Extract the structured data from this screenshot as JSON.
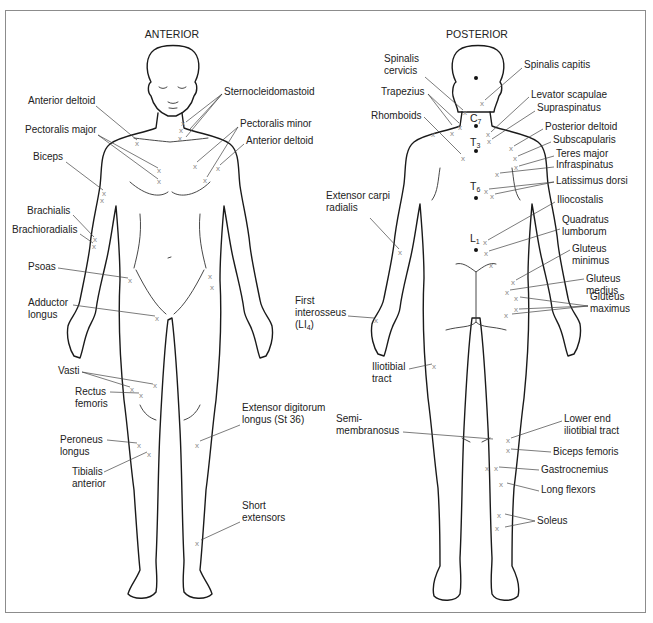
{
  "figure": {
    "anterior_title": "ANTERIOR",
    "posterior_title": "POSTERIOR",
    "accent_colors": {
      "outline": "#1a1a1a",
      "xmark": "#8a8a8a",
      "frame": "#8c8c8c"
    }
  },
  "anterior": {
    "labels": [
      {
        "id": "anterior-deltoid-left",
        "lines": [
          "Anterior deltoid"
        ],
        "x": 28,
        "y": 104,
        "anchor": "start",
        "leaders": [
          [
            96,
            106,
            137,
            140
          ]
        ],
        "marks": [
          [
            137,
            143
          ]
        ]
      },
      {
        "id": "pectoralis-major",
        "lines": [
          "Pectoralis major"
        ],
        "x": 25,
        "y": 133,
        "anchor": "start",
        "leaders": [
          [
            98,
            135,
            158,
            168
          ],
          [
            98,
            135,
            158,
            179
          ]
        ],
        "marks": [
          [
            159,
            170
          ],
          [
            159,
            181
          ]
        ]
      },
      {
        "id": "biceps",
        "lines": [
          "Biceps"
        ],
        "x": 33,
        "y": 160,
        "anchor": "start",
        "leaders": [
          [
            66,
            162,
            103,
            190
          ]
        ],
        "marks": [
          [
            104,
            193
          ],
          [
            102,
            200
          ]
        ]
      },
      {
        "id": "brachialis",
        "lines": [
          "Brachialis"
        ],
        "x": 27,
        "y": 214,
        "anchor": "start",
        "leaders": [
          [
            73,
            215,
            94,
            237
          ]
        ],
        "marks": [
          [
            95,
            239
          ]
        ]
      },
      {
        "id": "brachioradialis",
        "lines": [
          "Brachioradialis"
        ],
        "x": 12,
        "y": 233,
        "anchor": "start",
        "leaders": [
          [
            80,
            234,
            93,
            243
          ]
        ],
        "marks": [
          [
            94,
            246
          ]
        ]
      },
      {
        "id": "psoas",
        "lines": [
          "Psoas"
        ],
        "x": 28,
        "y": 270,
        "anchor": "start",
        "leaders": [
          [
            58,
            268,
            128,
            278
          ]
        ],
        "marks": [
          [
            130,
            280
          ]
        ]
      },
      {
        "id": "adductor-longus",
        "lines": [
          "Adductor",
          "longus"
        ],
        "x": 28,
        "y": 306,
        "anchor": "start",
        "leaders": [
          [
            73,
            305,
            155,
            316
          ]
        ],
        "marks": [
          [
            157,
            318
          ]
        ]
      },
      {
        "id": "vasti",
        "lines": [
          "Vasti"
        ],
        "x": 58,
        "y": 374,
        "anchor": "start",
        "leaders": [
          [
            82,
            372,
            130,
            387
          ],
          [
            82,
            372,
            153,
            384
          ]
        ],
        "marks": [
          [
            132,
            389
          ],
          [
            155,
            385
          ]
        ]
      },
      {
        "id": "rectus-femoris",
        "lines": [
          "Rectus",
          "femoris"
        ],
        "x": 75,
        "y": 395,
        "anchor": "start",
        "leaders": [
          [
            110,
            392,
            139,
            393
          ]
        ],
        "marks": [
          [
            141,
            395
          ]
        ]
      },
      {
        "id": "peroneus-longus",
        "lines": [
          "Peroneus",
          "longus"
        ],
        "x": 60,
        "y": 443,
        "anchor": "start",
        "leaders": [
          [
            107,
            440,
            137,
            443
          ]
        ],
        "marks": [
          [
            139,
            445
          ]
        ]
      },
      {
        "id": "tibialis-anterior",
        "lines": [
          "Tibialis",
          "anterior"
        ],
        "x": 72,
        "y": 475,
        "anchor": "start",
        "leaders": [
          [
            104,
            472,
            147,
            452
          ]
        ],
        "marks": [
          [
            149,
            454
          ]
        ]
      },
      {
        "id": "sternocleidomastoid",
        "lines": [
          "Sternocleidomastoid"
        ],
        "x": 224,
        "y": 95,
        "anchor": "start",
        "leaders": [
          [
            222,
            94,
            186,
            122
          ],
          [
            222,
            94,
            190,
            129
          ],
          [
            222,
            94,
            186,
            137
          ]
        ],
        "marks": [
          [
            183,
            123
          ],
          [
            181,
            130
          ],
          [
            180,
            138
          ]
        ]
      },
      {
        "id": "pectoralis-minor",
        "lines": [
          "Pectoralis minor"
        ],
        "x": 240,
        "y": 127,
        "anchor": "start",
        "leaders": [
          [
            238,
            127,
            197,
            162
          ],
          [
            238,
            127,
            207,
            177
          ]
        ],
        "marks": [
          [
            195,
            166
          ],
          [
            205,
            180
          ]
        ]
      },
      {
        "id": "anterior-deltoid-right",
        "lines": [
          "Anterior deltoid"
        ],
        "x": 246,
        "y": 144,
        "anchor": "start",
        "leaders": [
          [
            244,
            144,
            220,
            165
          ]
        ],
        "marks": [
          [
            218,
            168
          ]
        ]
      },
      {
        "id": "extensor-digitorum-longus",
        "lines": [
          "Extensor digitorum",
          "longus (St 36)"
        ],
        "x": 242,
        "y": 411,
        "anchor": "start",
        "leaders": [
          [
            240,
            425,
            200,
            441
          ]
        ],
        "marks": [
          [
            197,
            445
          ]
        ]
      },
      {
        "id": "short-extensors",
        "lines": [
          "Short",
          "extensors"
        ],
        "x": 242,
        "y": 509,
        "anchor": "start",
        "leaders": [
          [
            240,
            522,
            201,
            540
          ]
        ],
        "marks": [
          [
            197,
            543
          ]
        ]
      }
    ],
    "extra_marks": [
      [
        210,
        276
      ],
      [
        212,
        287
      ]
    ]
  },
  "posterior": {
    "labels": [
      {
        "id": "spinalis-cervicis",
        "lines": [
          "Spinalis",
          "cervicis"
        ],
        "x": 384,
        "y": 62,
        "anchor": "start",
        "leaders": [
          [
            425,
            77,
            463,
            110
          ]
        ],
        "marks": [
          [
            465,
            112
          ]
        ]
      },
      {
        "id": "spinalis-capitis",
        "lines": [
          "Spinalis capitis"
        ],
        "x": 524,
        "y": 68,
        "anchor": "start",
        "leaders": [
          [
            522,
            68,
            485,
            100
          ]
        ],
        "marks": [
          [
            482,
            103
          ]
        ]
      },
      {
        "id": "trapezius",
        "lines": [
          "Trapezius"
        ],
        "x": 381,
        "y": 95,
        "anchor": "start",
        "leaders": [
          [
            428,
            94,
            452,
            125
          ],
          [
            428,
            94,
            459,
            123
          ]
        ],
        "marks": [
          [
            452,
            133
          ],
          [
            460,
            127
          ]
        ]
      },
      {
        "id": "rhomboids",
        "lines": [
          "Rhomboids"
        ],
        "x": 371,
        "y": 119,
        "anchor": "start",
        "leaders": [
          [
            424,
            117,
            461,
            154
          ]
        ],
        "marks": [
          [
            463,
            158
          ]
        ]
      },
      {
        "id": "levator-scapulae",
        "lines": [
          "Levator scapulae"
        ],
        "x": 531,
        "y": 98,
        "anchor": "start",
        "leaders": [
          [
            529,
            97,
            491,
            132
          ]
        ],
        "marks": [
          [
            488,
            134
          ]
        ]
      },
      {
        "id": "supraspinatus",
        "lines": [
          "Supraspinatus"
        ],
        "x": 537,
        "y": 111,
        "anchor": "start",
        "leaders": [
          [
            535,
            111,
            492,
            139
          ]
        ],
        "marks": [
          [
            489,
            141
          ]
        ]
      },
      {
        "id": "posterior-deltoid",
        "lines": [
          "Posterior deltoid"
        ],
        "x": 545,
        "y": 130,
        "anchor": "start",
        "leaders": [
          [
            543,
            129,
            514,
            146
          ]
        ],
        "marks": [
          [
            511,
            148
          ]
        ]
      },
      {
        "id": "subscapularis",
        "lines": [
          "Subscapularis"
        ],
        "x": 553,
        "y": 143,
        "anchor": "start",
        "leaders": [
          [
            551,
            142,
            518,
            156
          ]
        ],
        "marks": [
          [
            515,
            158
          ]
        ]
      },
      {
        "id": "teres-major",
        "lines": [
          "Teres major"
        ],
        "x": 556,
        "y": 157,
        "anchor": "start",
        "leaders": [
          [
            554,
            156,
            519,
            166
          ]
        ],
        "marks": [
          [
            516,
            167
          ]
        ]
      },
      {
        "id": "infraspinatus",
        "lines": [
          "Infraspinatus"
        ],
        "x": 556,
        "y": 168,
        "anchor": "start",
        "leaders": [
          [
            554,
            167,
            500,
            173
          ]
        ],
        "marks": [
          [
            497,
            174
          ]
        ]
      },
      {
        "id": "latissimus-dorsi",
        "lines": [
          "Latissimus dorsi"
        ],
        "x": 556,
        "y": 184,
        "anchor": "start",
        "leaders": [
          [
            554,
            182,
            489,
            189
          ],
          [
            554,
            182,
            495,
            194
          ]
        ],
        "marks": [
          [
            486,
            191
          ],
          [
            492,
            196
          ]
        ]
      },
      {
        "id": "iliocostalis",
        "lines": [
          "Iliocostalis"
        ],
        "x": 557,
        "y": 203,
        "anchor": "start",
        "leaders": [
          [
            555,
            202,
            488,
            240
          ]
        ],
        "marks": [
          [
            485,
            242
          ]
        ]
      },
      {
        "id": "quadratus-lumborum",
        "lines": [
          "Quadratus",
          "lumborum"
        ],
        "x": 562,
        "y": 223,
        "anchor": "start",
        "leaders": [
          [
            560,
            229,
            489,
            251
          ]
        ],
        "marks": [
          [
            486,
            253
          ]
        ]
      },
      {
        "id": "gluteus-minimus",
        "lines": [
          "Gluteus",
          "minimus"
        ],
        "x": 572,
        "y": 252,
        "anchor": "start",
        "leaders": [
          [
            570,
            250,
            516,
            280
          ]
        ],
        "marks": [
          [
            513,
            282
          ]
        ]
      },
      {
        "id": "gluteus-medius",
        "lines": [
          "Gluteus",
          "medius"
        ],
        "x": 586,
        "y": 282,
        "anchor": "start",
        "leaders": [
          [
            584,
            279,
            510,
            290
          ]
        ],
        "marks": [
          [
            507,
            292
          ]
        ]
      },
      {
        "id": "gluteus-maximus",
        "lines": [
          "Gluteus",
          "maximus"
        ],
        "x": 590,
        "y": 300,
        "anchor": "start",
        "leaders": [
          [
            588,
            306,
            520,
            297
          ],
          [
            588,
            306,
            519,
            309
          ],
          [
            588,
            306,
            512,
            314
          ]
        ],
        "marks": [
          [
            516,
            298
          ],
          [
            516,
            309
          ],
          [
            506,
            315
          ]
        ]
      },
      {
        "id": "extensor-carpi-radialis",
        "lines": [
          "Extensor carpi",
          "radialis"
        ],
        "x": 326,
        "y": 199,
        "anchor": "start",
        "leaders": [
          [
            370,
            218,
            399,
            249
          ]
        ],
        "marks": [
          [
            400,
            252
          ]
        ]
      },
      {
        "id": "first-interosseus",
        "lines": [
          "First",
          "interosseus",
          "(LI4)"
        ],
        "x": 295,
        "y": 304,
        "anchor": "start",
        "leaders": [
          [
            348,
            316,
            374,
            318
          ]
        ],
        "marks": [
          [
            376,
            320
          ]
        ]
      },
      {
        "id": "iliotibial-tract",
        "lines": [
          "Iliotibial",
          "tract"
        ],
        "x": 372,
        "y": 370,
        "anchor": "start",
        "leaders": [
          [
            409,
            369,
            432,
            364
          ]
        ],
        "marks": [
          [
            434,
            366
          ]
        ]
      },
      {
        "id": "semimembranosus",
        "lines": [
          "Semi-",
          "membranosus"
        ],
        "x": 336,
        "y": 422,
        "anchor": "start",
        "leaders": [
          [
            403,
            432,
            493,
            439
          ]
        ],
        "marks": []
      },
      {
        "id": "lower-end-iliotibial-tract",
        "lines": [
          "Lower end",
          "iliotibial tract"
        ],
        "x": 564,
        "y": 422,
        "anchor": "start",
        "leaders": [
          [
            562,
            421,
            511,
            438
          ]
        ],
        "marks": [
          [
            508,
            440
          ]
        ]
      },
      {
        "id": "biceps-femoris",
        "lines": [
          "Biceps femoris"
        ],
        "x": 553,
        "y": 455,
        "anchor": "start",
        "leaders": [
          [
            551,
            452,
            511,
            449
          ]
        ],
        "marks": [
          [
            508,
            450
          ]
        ]
      },
      {
        "id": "gastrocnemius",
        "lines": [
          "Gastrocnemius"
        ],
        "x": 541,
        "y": 473,
        "anchor": "start",
        "leaders": [
          [
            539,
            470,
            499,
            467
          ]
        ],
        "marks": [
          [
            487,
            468
          ],
          [
            496,
            468
          ]
        ]
      },
      {
        "id": "long-flexors",
        "lines": [
          "Long flexors"
        ],
        "x": 541,
        "y": 493,
        "anchor": "start",
        "leaders": [
          [
            539,
            491,
            507,
            483
          ]
        ],
        "marks": [
          [
            501,
            484
          ]
        ]
      },
      {
        "id": "soleus",
        "lines": [
          "Soleus"
        ],
        "x": 537,
        "y": 524,
        "anchor": "start",
        "leaders": [
          [
            535,
            521,
            505,
            514
          ],
          [
            535,
            521,
            505,
            527
          ]
        ],
        "marks": [
          [
            499,
            515
          ],
          [
            497,
            528
          ]
        ]
      }
    ],
    "vertebrae": [
      {
        "main": "C",
        "sub": "7",
        "x": 470,
        "y": 122,
        "dot": [
          476,
          126
        ]
      },
      {
        "main": "T",
        "sub": "3",
        "x": 470,
        "y": 146,
        "dot": [
          476,
          151
        ]
      },
      {
        "main": "T",
        "sub": "6",
        "x": 470,
        "y": 190,
        "dot": [
          476,
          198
        ]
      },
      {
        "main": "L",
        "sub": "1",
        "x": 470,
        "y": 242,
        "dot": [
          476,
          250
        ]
      }
    ],
    "head_dot": [
      476,
      78
    ],
    "extra_marks": [
      [
        491,
        265
      ],
      [
        433,
        134
      ]
    ]
  }
}
